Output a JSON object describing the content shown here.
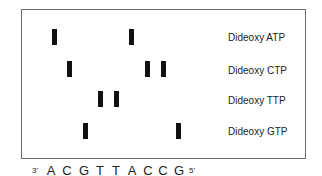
{
  "lanes": [
    {
      "label": "Dideoxy ATP",
      "base": "A",
      "band_columns": [
        1,
        6
      ]
    },
    {
      "label": "Dideoxy CTP",
      "base": "C",
      "band_columns": [
        2,
        7,
        8
      ]
    },
    {
      "label": "Dideoxy TTP",
      "base": "T",
      "band_columns": [
        4,
        5
      ]
    },
    {
      "label": "Dideoxy GTP",
      "base": "G",
      "band_columns": [
        3,
        9
      ]
    }
  ],
  "sequence": {
    "start_label": "3'",
    "end_label": "5'",
    "bases": [
      "A",
      "C",
      "G",
      "T",
      "T",
      "A",
      "C",
      "C",
      "G"
    ]
  },
  "colors": {
    "band": "#111111",
    "frame": "#6b6b6b",
    "text": "#222222"
  }
}
